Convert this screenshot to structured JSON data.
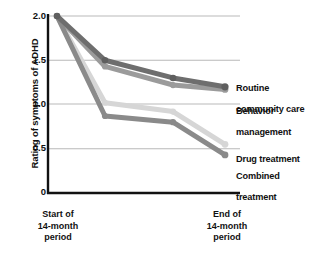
{
  "chart_data": {
    "type": "line",
    "title": "",
    "xlabel": "",
    "ylabel": "Rating of symptoms of ADHD",
    "ylim": [
      0,
      2.0
    ],
    "yticks": [
      "0",
      "0.5",
      "1.0",
      "1.5",
      "2.0"
    ],
    "ytick_values": [
      0,
      0.5,
      1.0,
      1.5,
      2.0
    ],
    "grid": true,
    "legend_position": "right-inline",
    "x": [
      0,
      1,
      2,
      3
    ],
    "xtick_labels": [
      "Start of\n14-month\nperiod",
      "",
      "",
      "End of\n14-month\nperiod"
    ],
    "series": [
      {
        "name": "Routine community care",
        "values": [
          2.0,
          1.5,
          1.3,
          1.2
        ],
        "color": "#6e6e6e"
      },
      {
        "name": "Behavior management",
        "values": [
          2.0,
          1.43,
          1.22,
          1.17
        ],
        "color": "#9b9b9b"
      },
      {
        "name": "Drug treatment",
        "values": [
          2.0,
          1.02,
          0.92,
          0.55
        ],
        "color": "#d6d6d6"
      },
      {
        "name": "Combined treatment",
        "values": [
          2.0,
          0.87,
          0.8,
          0.43
        ],
        "color": "#8a8a8a"
      }
    ]
  },
  "axis": {
    "ylabel": "Rating of symptoms of ADHD",
    "tick_2_0": "2.0",
    "tick_1_5": "1.5",
    "tick_1_0": "1.0",
    "tick_0_5": "0.5",
    "tick_0": "0",
    "xleft_line1": "Start of",
    "xleft_line2": "14-month",
    "xleft_line3": "period",
    "xright_line1": "End of",
    "xright_line2": "14-month",
    "xright_line3": "period"
  },
  "legend": {
    "routine_line1": "Routine",
    "routine_line2": "community care",
    "behavior_line1": "Behavior",
    "behavior_line2": "management",
    "drug_line1": "Drug treatment",
    "combined_line1": "Combined",
    "combined_line2": "treatment"
  },
  "colors": {
    "axis": "#111111",
    "grid": "#b9b9b9",
    "routine": "#6e6e6e",
    "behavior": "#9b9b9b",
    "drug": "#d6d6d6",
    "combined": "#8a8a8a"
  }
}
